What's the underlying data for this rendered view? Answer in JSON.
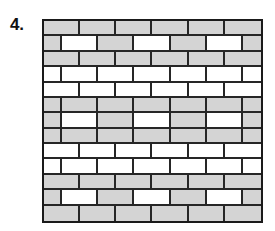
{
  "figure": {
    "label": "4.",
    "colors": {
      "brick_gray": "#d4d4d4",
      "brick_white": "#ffffff",
      "mortar_line": "#262626",
      "wall_border": "#1a1a1a",
      "background": "#ffffff",
      "label_text": "#111111"
    },
    "wall": {
      "rows": 13,
      "bricks_per_full_row": 6,
      "row_kinds": [
        "full",
        "offset"
      ],
      "rows_data": [
        {
          "index": 1,
          "kind": "full",
          "bricks": [
            "gray",
            "gray",
            "gray",
            "gray",
            "gray",
            "gray"
          ]
        },
        {
          "index": 2,
          "kind": "offset",
          "bricks": [
            "gray",
            "white",
            "gray",
            "white",
            "gray",
            "white",
            "gray"
          ]
        },
        {
          "index": 3,
          "kind": "full",
          "bricks": [
            "gray",
            "gray",
            "gray",
            "gray",
            "gray",
            "gray"
          ]
        },
        {
          "index": 4,
          "kind": "offset",
          "bricks": [
            "white",
            "white",
            "white",
            "white",
            "white",
            "white",
            "white"
          ]
        },
        {
          "index": 5,
          "kind": "full",
          "bricks": [
            "white",
            "white",
            "white",
            "white",
            "white",
            "white"
          ]
        },
        {
          "index": 6,
          "kind": "offset",
          "bricks": [
            "gray",
            "gray",
            "gray",
            "gray",
            "gray",
            "gray",
            "gray"
          ]
        },
        {
          "index": 7,
          "kind": "offset",
          "bricks": [
            "gray",
            "white",
            "gray",
            "white",
            "gray",
            "white",
            "gray"
          ]
        },
        {
          "index": 8,
          "kind": "offset",
          "bricks": [
            "gray",
            "gray",
            "gray",
            "gray",
            "gray",
            "gray",
            "gray"
          ]
        },
        {
          "index": 9,
          "kind": "full",
          "bricks": [
            "white",
            "white",
            "white",
            "white",
            "white",
            "white"
          ]
        },
        {
          "index": 10,
          "kind": "offset",
          "bricks": [
            "white",
            "white",
            "white",
            "white",
            "white",
            "white",
            "white"
          ]
        },
        {
          "index": 11,
          "kind": "full",
          "bricks": [
            "gray",
            "gray",
            "gray",
            "gray",
            "gray",
            "gray"
          ]
        },
        {
          "index": 12,
          "kind": "offset",
          "bricks": [
            "gray",
            "white",
            "gray",
            "white",
            "gray",
            "white",
            "gray"
          ]
        },
        {
          "index": 13,
          "kind": "full",
          "bricks": [
            "gray",
            "gray",
            "gray",
            "gray",
            "gray",
            "gray"
          ]
        }
      ]
    }
  }
}
